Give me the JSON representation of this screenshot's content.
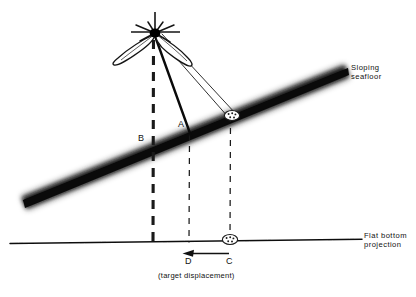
{
  "figure": {
    "type": "schematic-diagram",
    "background_color": "#ffffff",
    "ink_color": "#111111"
  },
  "labels": {
    "sloping_seafloor": "Sloping\nseafloor",
    "flat_bottom_projection": "Flat bottom\nprojection",
    "point_a": "A",
    "point_b": "B",
    "point_c": "C",
    "point_d": "D",
    "target_displacement": "(target displacement)"
  },
  "elements": {
    "transducer": "transducer-source",
    "beam_lobe_left": "beam-lobe-left",
    "beam_lobe_right": "beam-lobe-right",
    "slope_band": "sloping-seafloor-band",
    "flat_line": "flat-bottom-line",
    "target_on_slope": "target-on-slope",
    "target_on_flat": "target-on-flat",
    "displacement_arrow": "displacement-arrow"
  },
  "geometry": {
    "source": {
      "x": 155,
      "y": 33
    },
    "point_b_on_slope": {
      "x": 153,
      "y": 146
    },
    "point_a_on_slope": {
      "x": 190,
      "y": 134
    },
    "target_slope": {
      "x": 232,
      "y": 115
    },
    "target_flat": {
      "x": 230,
      "y": 240
    },
    "point_d_on_flat": {
      "x": 189,
      "y": 241
    },
    "slope_left_end": {
      "x": 22,
      "y": 205
    },
    "slope_right_end": {
      "x": 348,
      "y": 72
    },
    "flat_left_end": {
      "x": 10,
      "y": 243
    },
    "flat_right_end": {
      "x": 360,
      "y": 239
    }
  }
}
